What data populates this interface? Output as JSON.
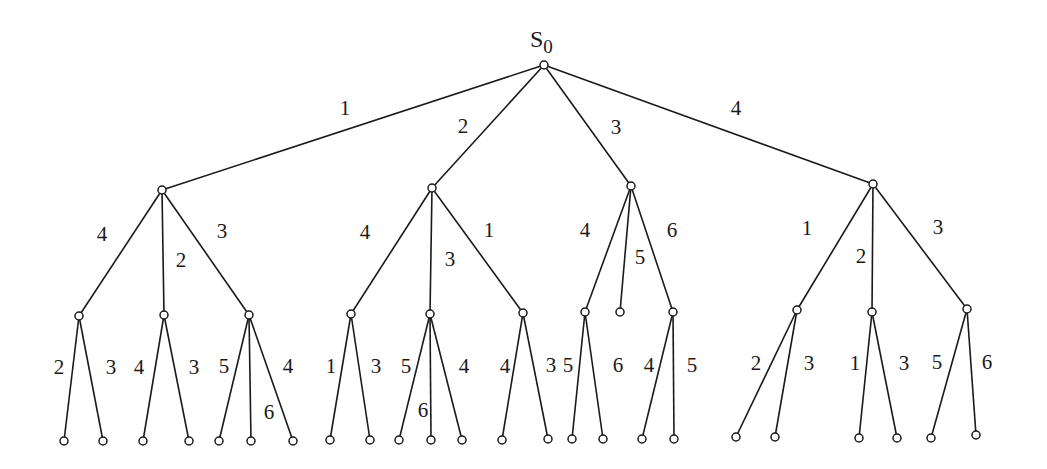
{
  "diagram": {
    "type": "search-tree",
    "root_label": "S",
    "root_subscript": "0",
    "colors": {
      "line": "#1a1a1a",
      "node_fill": "#ffffff",
      "background": "#ffffff"
    },
    "node_radius": 4,
    "nodes": [
      {
        "id": "root",
        "x": 544,
        "y": 65
      },
      {
        "id": "a",
        "x": 162,
        "y": 190
      },
      {
        "id": "b",
        "x": 432,
        "y": 188
      },
      {
        "id": "c",
        "x": 631,
        "y": 186
      },
      {
        "id": "d",
        "x": 873,
        "y": 184
      },
      {
        "id": "a1",
        "x": 79,
        "y": 316
      },
      {
        "id": "a2",
        "x": 164,
        "y": 315
      },
      {
        "id": "a3",
        "x": 249,
        "y": 315
      },
      {
        "id": "b1",
        "x": 351,
        "y": 314
      },
      {
        "id": "b2",
        "x": 430,
        "y": 314
      },
      {
        "id": "b3",
        "x": 523,
        "y": 313
      },
      {
        "id": "c1",
        "x": 585,
        "y": 312
      },
      {
        "id": "c2",
        "x": 620,
        "y": 312
      },
      {
        "id": "c3",
        "x": 673,
        "y": 312
      },
      {
        "id": "d1",
        "x": 797,
        "y": 310
      },
      {
        "id": "d2",
        "x": 872,
        "y": 312
      },
      {
        "id": "d3",
        "x": 967,
        "y": 309
      },
      {
        "id": "a1l",
        "x": 64,
        "y": 441
      },
      {
        "id": "a1r",
        "x": 103,
        "y": 441
      },
      {
        "id": "a2l",
        "x": 143,
        "y": 441
      },
      {
        "id": "a2r",
        "x": 189,
        "y": 441
      },
      {
        "id": "a3l",
        "x": 219,
        "y": 441
      },
      {
        "id": "a3m",
        "x": 251,
        "y": 441
      },
      {
        "id": "a3r",
        "x": 293,
        "y": 441
      },
      {
        "id": "b1l",
        "x": 330,
        "y": 440
      },
      {
        "id": "b1r",
        "x": 370,
        "y": 440
      },
      {
        "id": "b2l",
        "x": 399,
        "y": 440
      },
      {
        "id": "b2m",
        "x": 431,
        "y": 440
      },
      {
        "id": "b2r",
        "x": 462,
        "y": 440
      },
      {
        "id": "b3l",
        "x": 502,
        "y": 440
      },
      {
        "id": "b3r",
        "x": 548,
        "y": 439
      },
      {
        "id": "c1l",
        "x": 572,
        "y": 439
      },
      {
        "id": "c1r",
        "x": 603,
        "y": 439
      },
      {
        "id": "c3l",
        "x": 642,
        "y": 439
      },
      {
        "id": "c3r",
        "x": 674,
        "y": 439
      },
      {
        "id": "d1l",
        "x": 736,
        "y": 437
      },
      {
        "id": "d1r",
        "x": 775,
        "y": 437
      },
      {
        "id": "d2l",
        "x": 859,
        "y": 438
      },
      {
        "id": "d2r",
        "x": 897,
        "y": 438
      },
      {
        "id": "d3l",
        "x": 931,
        "y": 438
      },
      {
        "id": "d3r",
        "x": 976,
        "y": 435
      }
    ],
    "edges": [
      {
        "from": "root",
        "to": "a",
        "label": "1",
        "lx": 345,
        "ly": 110
      },
      {
        "from": "root",
        "to": "b",
        "label": "2",
        "lx": 463,
        "ly": 128
      },
      {
        "from": "root",
        "to": "c",
        "label": "3",
        "lx": 616,
        "ly": 129
      },
      {
        "from": "root",
        "to": "d",
        "label": "4",
        "lx": 736,
        "ly": 110
      },
      {
        "from": "a",
        "to": "a1",
        "label": "4",
        "lx": 102,
        "ly": 236
      },
      {
        "from": "a",
        "to": "a2",
        "label": "2",
        "lx": 181,
        "ly": 262
      },
      {
        "from": "a",
        "to": "a3",
        "label": "3",
        "lx": 222,
        "ly": 233
      },
      {
        "from": "b",
        "to": "b1",
        "label": "4",
        "lx": 365,
        "ly": 234
      },
      {
        "from": "b",
        "to": "b2",
        "label": "3",
        "lx": 450,
        "ly": 261
      },
      {
        "from": "b",
        "to": "b3",
        "label": "1",
        "lx": 489,
        "ly": 232
      },
      {
        "from": "c",
        "to": "c1",
        "label": "4",
        "lx": 585,
        "ly": 232
      },
      {
        "from": "c",
        "to": "c2",
        "label": "5",
        "lx": 640,
        "ly": 259
      },
      {
        "from": "c",
        "to": "c3",
        "label": "6",
        "lx": 672,
        "ly": 232
      },
      {
        "from": "d",
        "to": "d1",
        "label": "1",
        "lx": 807,
        "ly": 230
      },
      {
        "from": "d",
        "to": "d2",
        "label": "2",
        "lx": 861,
        "ly": 258
      },
      {
        "from": "d",
        "to": "d3",
        "label": "3",
        "lx": 938,
        "ly": 229
      },
      {
        "from": "a1",
        "to": "a1l",
        "label": "2",
        "lx": 59,
        "ly": 369
      },
      {
        "from": "a1",
        "to": "a1r",
        "label": "3",
        "lx": 111,
        "ly": 369
      },
      {
        "from": "a2",
        "to": "a2l",
        "label": "4",
        "lx": 139,
        "ly": 369
      },
      {
        "from": "a2",
        "to": "a2r",
        "label": "3",
        "lx": 194,
        "ly": 369
      },
      {
        "from": "a3",
        "to": "a3l",
        "label": "5",
        "lx": 224,
        "ly": 368
      },
      {
        "from": "a3",
        "to": "a3m",
        "label": "6",
        "lx": 269,
        "ly": 414
      },
      {
        "from": "a3",
        "to": "a3r",
        "label": "4",
        "lx": 288,
        "ly": 368
      },
      {
        "from": "b1",
        "to": "b1l",
        "label": "1",
        "lx": 331,
        "ly": 368
      },
      {
        "from": "b1",
        "to": "b1r",
        "label": "3",
        "lx": 376,
        "ly": 368
      },
      {
        "from": "b2",
        "to": "b2l",
        "label": "5",
        "lx": 406,
        "ly": 368
      },
      {
        "from": "b2",
        "to": "b2m",
        "label": "6",
        "lx": 423,
        "ly": 412
      },
      {
        "from": "b2",
        "to": "b2r",
        "label": "4",
        "lx": 464,
        "ly": 368
      },
      {
        "from": "b3",
        "to": "b3l",
        "label": "4",
        "lx": 505,
        "ly": 368
      },
      {
        "from": "b3",
        "to": "b3r",
        "label": "3",
        "lx": 551,
        "ly": 367
      },
      {
        "from": "c1",
        "to": "c1l",
        "label": "5",
        "lx": 568,
        "ly": 367
      },
      {
        "from": "c1",
        "to": "c1r",
        "label": "6",
        "lx": 618,
        "ly": 367
      },
      {
        "from": "c3",
        "to": "c3l",
        "label": "4",
        "lx": 649,
        "ly": 367
      },
      {
        "from": "c3",
        "to": "c3r",
        "label": "5",
        "lx": 692,
        "ly": 367
      },
      {
        "from": "d1",
        "to": "d1l",
        "label": "2",
        "lx": 756,
        "ly": 365
      },
      {
        "from": "d1",
        "to": "d1r",
        "label": "3",
        "lx": 809,
        "ly": 365
      },
      {
        "from": "d2",
        "to": "d2l",
        "label": "1",
        "lx": 855,
        "ly": 365
      },
      {
        "from": "d2",
        "to": "d2r",
        "label": "3",
        "lx": 904,
        "ly": 365
      },
      {
        "from": "d3",
        "to": "d3l",
        "label": "5",
        "lx": 937,
        "ly": 364
      },
      {
        "from": "d3",
        "to": "d3r",
        "label": "6",
        "lx": 987,
        "ly": 364
      }
    ],
    "root_label_pos": {
      "x": 530,
      "y": 47
    }
  }
}
